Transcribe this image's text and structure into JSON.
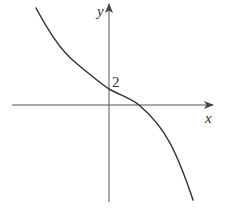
{
  "figure": {
    "type": "function-graph",
    "x_axis_label": "x",
    "y_axis_label": "y",
    "y_intercept_label": "2",
    "colors": {
      "axis": "#555555",
      "curve": "#333333",
      "background": "#ffffff"
    }
  },
  "curve": {
    "description": "Decreasing cubic-like curve, concave up on left, concave down on right, with y-intercept 2 and one positive x-intercept",
    "y_intercept": 2,
    "trend": "decreasing"
  }
}
